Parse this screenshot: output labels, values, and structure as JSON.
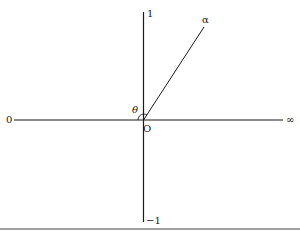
{
  "diagram": {
    "labels": {
      "top": "1",
      "bottom": "−1",
      "left": "0",
      "right": "∞",
      "origin": "O",
      "ray": "α",
      "angle": "θ"
    },
    "colors": {
      "line": "#1a1a1a",
      "background": "#ffffff",
      "rule": "#444444"
    }
  }
}
